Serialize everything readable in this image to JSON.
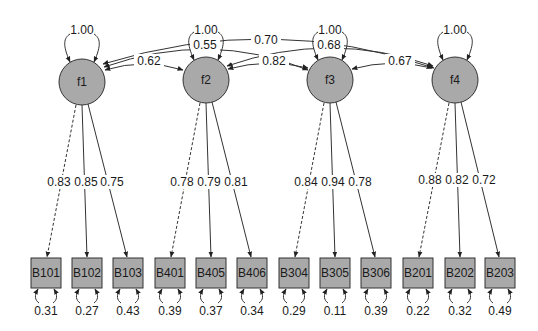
{
  "diagram": {
    "type": "cfa-path-diagram",
    "colors": {
      "node_fill": "#a9a9a9",
      "stroke": "#333333",
      "background": "#ffffff"
    },
    "factors": [
      {
        "id": "f1",
        "label": "f1",
        "variance": "1.00",
        "cx": 82,
        "cy": 82
      },
      {
        "id": "f2",
        "label": "f2",
        "variance": "1.00",
        "cx": 206,
        "cy": 80
      },
      {
        "id": "f3",
        "label": "f3",
        "variance": "1.00",
        "cx": 330,
        "cy": 80
      },
      {
        "id": "f4",
        "label": "f4",
        "variance": "1.00",
        "cx": 455,
        "cy": 80
      }
    ],
    "covariances": [
      {
        "from": "f1",
        "to": "f2",
        "value": "0.62"
      },
      {
        "from": "f1",
        "to": "f3",
        "value": "0.55"
      },
      {
        "from": "f1",
        "to": "f4",
        "value": "0.70"
      },
      {
        "from": "f2",
        "to": "f3",
        "value": "0.82"
      },
      {
        "from": "f2",
        "to": "f4",
        "value": "0.68"
      },
      {
        "from": "f3",
        "to": "f4",
        "value": "0.67"
      }
    ],
    "indicators": [
      {
        "label": "B101",
        "factor": "f1",
        "loading": "0.83",
        "fixed": true,
        "residual": "0.31",
        "cx": 46
      },
      {
        "label": "B102",
        "factor": "f1",
        "loading": "0.85",
        "fixed": false,
        "residual": "0.27",
        "cx": 87
      },
      {
        "label": "B103",
        "factor": "f1",
        "loading": "0.75",
        "fixed": false,
        "residual": "0.43",
        "cx": 128
      },
      {
        "label": "B401",
        "factor": "f2",
        "loading": "0.78",
        "fixed": true,
        "residual": "0.39",
        "cx": 170
      },
      {
        "label": "B405",
        "factor": "f2",
        "loading": "0.79",
        "fixed": false,
        "residual": "0.37",
        "cx": 211
      },
      {
        "label": "B406",
        "factor": "f2",
        "loading": "0.81",
        "fixed": false,
        "residual": "0.34",
        "cx": 252
      },
      {
        "label": "B304",
        "factor": "f3",
        "loading": "0.84",
        "fixed": true,
        "residual": "0.29",
        "cx": 294
      },
      {
        "label": "B305",
        "factor": "f3",
        "loading": "0.94",
        "fixed": false,
        "residual": "0.11",
        "cx": 335
      },
      {
        "label": "B306",
        "factor": "f3",
        "loading": "0.78",
        "fixed": false,
        "residual": "0.39",
        "cx": 376
      },
      {
        "label": "B201",
        "factor": "f4",
        "loading": "0.88",
        "fixed": true,
        "residual": "0.22",
        "cx": 418
      },
      {
        "label": "B202",
        "factor": "f4",
        "loading": "0.82",
        "fixed": false,
        "residual": "0.32",
        "cx": 460
      },
      {
        "label": "B203",
        "factor": "f4",
        "loading": "0.72",
        "fixed": false,
        "residual": "0.49",
        "cx": 500
      }
    ]
  }
}
